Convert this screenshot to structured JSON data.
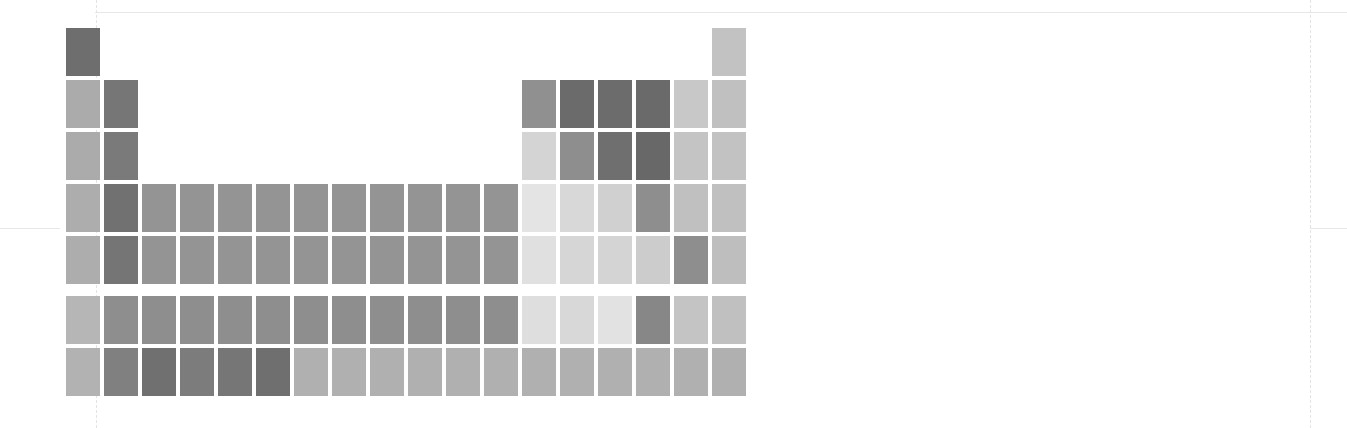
{
  "chart_data": {
    "type": "heatmap",
    "title": "",
    "subtitle": "",
    "xlabel": "",
    "ylabel": "",
    "grid": false,
    "legend_position": "none",
    "layout": "periodic-table",
    "columns": 18,
    "rows": 9,
    "colormap": "greys",
    "value_range": [
      0,
      1
    ],
    "color_scale_min_hex": "#f0f0f0",
    "color_scale_max_hex": "#5a5a5a",
    "background_hex": "#ffffff",
    "cell_width_px": 34,
    "cell_height_px": 48,
    "cell_gap_px": 4,
    "origin_x_px": 66,
    "origin_y_px": 28,
    "f_block_gap_px": 8,
    "guides": {
      "vertical_x_px": [
        38,
        96,
        1310
      ],
      "horizontal_y_px": [
        12,
        228
      ],
      "color_hex": "#e5e5e8"
    },
    "cells": [
      {
        "symbol": "H",
        "col": 1,
        "row": 1,
        "value": 0.62,
        "color": "#6e6e6e"
      },
      {
        "symbol": "He",
        "col": 18,
        "row": 1,
        "value": 0.25,
        "color": "#c2c2c2"
      },
      {
        "symbol": "Li",
        "col": 1,
        "row": 2,
        "value": 0.35,
        "color": "#ababab"
      },
      {
        "symbol": "Be",
        "col": 2,
        "row": 2,
        "value": 0.6,
        "color": "#767676"
      },
      {
        "symbol": "B",
        "col": 13,
        "row": 2,
        "value": 0.47,
        "color": "#909090"
      },
      {
        "symbol": "C",
        "col": 14,
        "row": 2,
        "value": 0.66,
        "color": "#6b6b6b"
      },
      {
        "symbol": "N",
        "col": 15,
        "row": 2,
        "value": 0.66,
        "color": "#6c6c6c"
      },
      {
        "symbol": "O",
        "col": 16,
        "row": 2,
        "value": 0.67,
        "color": "#6a6a6a"
      },
      {
        "symbol": "F",
        "col": 17,
        "row": 2,
        "value": 0.22,
        "color": "#c8c8c8"
      },
      {
        "symbol": "Ne",
        "col": 18,
        "row": 2,
        "value": 0.26,
        "color": "#c0c0c0"
      },
      {
        "symbol": "Na",
        "col": 1,
        "row": 3,
        "value": 0.35,
        "color": "#ababab"
      },
      {
        "symbol": "Mg",
        "col": 2,
        "row": 3,
        "value": 0.58,
        "color": "#7a7a7a"
      },
      {
        "symbol": "Al",
        "col": 13,
        "row": 3,
        "value": 0.16,
        "color": "#d4d4d4"
      },
      {
        "symbol": "Si",
        "col": 14,
        "row": 3,
        "value": 0.48,
        "color": "#8e8e8e"
      },
      {
        "symbol": "P",
        "col": 15,
        "row": 3,
        "value": 0.64,
        "color": "#6f6f6f"
      },
      {
        "symbol": "S",
        "col": 16,
        "row": 3,
        "value": 0.68,
        "color": "#686868"
      },
      {
        "symbol": "Cl",
        "col": 17,
        "row": 3,
        "value": 0.24,
        "color": "#c4c4c4"
      },
      {
        "symbol": "Ar",
        "col": 18,
        "row": 3,
        "value": 0.25,
        "color": "#c2c2c2"
      },
      {
        "symbol": "K",
        "col": 1,
        "row": 4,
        "value": 0.34,
        "color": "#adadad"
      },
      {
        "symbol": "Ca",
        "col": 2,
        "row": 4,
        "value": 0.62,
        "color": "#717171"
      },
      {
        "symbol": "Sc",
        "col": 3,
        "row": 4,
        "value": 0.45,
        "color": "#949494"
      },
      {
        "symbol": "Ti",
        "col": 4,
        "row": 4,
        "value": 0.45,
        "color": "#949494"
      },
      {
        "symbol": "V",
        "col": 5,
        "row": 4,
        "value": 0.45,
        "color": "#949494"
      },
      {
        "symbol": "Cr",
        "col": 6,
        "row": 4,
        "value": 0.45,
        "color": "#949494"
      },
      {
        "symbol": "Mn",
        "col": 7,
        "row": 4,
        "value": 0.45,
        "color": "#949494"
      },
      {
        "symbol": "Fe",
        "col": 8,
        "row": 4,
        "value": 0.45,
        "color": "#949494"
      },
      {
        "symbol": "Co",
        "col": 9,
        "row": 4,
        "value": 0.45,
        "color": "#949494"
      },
      {
        "symbol": "Ni",
        "col": 10,
        "row": 4,
        "value": 0.45,
        "color": "#949494"
      },
      {
        "symbol": "Cu",
        "col": 11,
        "row": 4,
        "value": 0.45,
        "color": "#949494"
      },
      {
        "symbol": "Zn",
        "col": 12,
        "row": 4,
        "value": 0.45,
        "color": "#949494"
      },
      {
        "symbol": "Ga",
        "col": 13,
        "row": 4,
        "value": 0.09,
        "color": "#e4e4e4"
      },
      {
        "symbol": "Ge",
        "col": 14,
        "row": 4,
        "value": 0.14,
        "color": "#d8d8d8"
      },
      {
        "symbol": "As",
        "col": 15,
        "row": 4,
        "value": 0.18,
        "color": "#d0d0d0"
      },
      {
        "symbol": "Se",
        "col": 16,
        "row": 4,
        "value": 0.48,
        "color": "#8e8e8e"
      },
      {
        "symbol": "Br",
        "col": 17,
        "row": 4,
        "value": 0.26,
        "color": "#c0c0c0"
      },
      {
        "symbol": "Kr",
        "col": 18,
        "row": 4,
        "value": 0.26,
        "color": "#c0c0c0"
      },
      {
        "symbol": "Rb",
        "col": 1,
        "row": 5,
        "value": 0.34,
        "color": "#adadad"
      },
      {
        "symbol": "Sr",
        "col": 2,
        "row": 5,
        "value": 0.6,
        "color": "#757575"
      },
      {
        "symbol": "Y",
        "col": 3,
        "row": 5,
        "value": 0.45,
        "color": "#949494"
      },
      {
        "symbol": "Zr",
        "col": 4,
        "row": 5,
        "value": 0.45,
        "color": "#949494"
      },
      {
        "symbol": "Nb",
        "col": 5,
        "row": 5,
        "value": 0.45,
        "color": "#949494"
      },
      {
        "symbol": "Mo",
        "col": 6,
        "row": 5,
        "value": 0.45,
        "color": "#949494"
      },
      {
        "symbol": "Tc",
        "col": 7,
        "row": 5,
        "value": 0.45,
        "color": "#949494"
      },
      {
        "symbol": "Ru",
        "col": 8,
        "row": 5,
        "value": 0.45,
        "color": "#949494"
      },
      {
        "symbol": "Rh",
        "col": 9,
        "row": 5,
        "value": 0.45,
        "color": "#949494"
      },
      {
        "symbol": "Pd",
        "col": 10,
        "row": 5,
        "value": 0.45,
        "color": "#949494"
      },
      {
        "symbol": "Ag",
        "col": 11,
        "row": 5,
        "value": 0.45,
        "color": "#949494"
      },
      {
        "symbol": "Cd",
        "col": 12,
        "row": 5,
        "value": 0.45,
        "color": "#949494"
      },
      {
        "symbol": "In",
        "col": 13,
        "row": 5,
        "value": 0.11,
        "color": "#e0e0e0"
      },
      {
        "symbol": "Sn",
        "col": 14,
        "row": 5,
        "value": 0.15,
        "color": "#d6d6d6"
      },
      {
        "symbol": "Sb",
        "col": 15,
        "row": 5,
        "value": 0.16,
        "color": "#d4d4d4"
      },
      {
        "symbol": "Te",
        "col": 16,
        "row": 5,
        "value": 0.2,
        "color": "#cccccc"
      },
      {
        "symbol": "I",
        "col": 17,
        "row": 5,
        "value": 0.48,
        "color": "#8e8e8e"
      },
      {
        "symbol": "Xe",
        "col": 18,
        "row": 5,
        "value": 0.27,
        "color": "#bebebe"
      },
      {
        "symbol": "Cs",
        "col": 1,
        "row": 6,
        "value": 0.3,
        "color": "#b6b6b6"
      },
      {
        "symbol": "Ba",
        "col": 2,
        "row": 6,
        "value": 0.48,
        "color": "#8e8e8e"
      },
      {
        "symbol": "La",
        "col": 3,
        "row": 6,
        "value": 0.48,
        "color": "#8e8e8e"
      },
      {
        "symbol": "Hf",
        "col": 4,
        "row": 6,
        "value": 0.48,
        "color": "#8e8e8e"
      },
      {
        "symbol": "Ta",
        "col": 5,
        "row": 6,
        "value": 0.48,
        "color": "#8e8e8e"
      },
      {
        "symbol": "W",
        "col": 6,
        "row": 6,
        "value": 0.48,
        "color": "#8e8e8e"
      },
      {
        "symbol": "Re",
        "col": 7,
        "row": 6,
        "value": 0.48,
        "color": "#8e8e8e"
      },
      {
        "symbol": "Os",
        "col": 8,
        "row": 6,
        "value": 0.48,
        "color": "#8e8e8e"
      },
      {
        "symbol": "Ir",
        "col": 9,
        "row": 6,
        "value": 0.48,
        "color": "#8e8e8e"
      },
      {
        "symbol": "Pt",
        "col": 10,
        "row": 6,
        "value": 0.48,
        "color": "#8e8e8e"
      },
      {
        "symbol": "Au",
        "col": 11,
        "row": 6,
        "value": 0.48,
        "color": "#8e8e8e"
      },
      {
        "symbol": "Hg",
        "col": 12,
        "row": 6,
        "value": 0.48,
        "color": "#8e8e8e"
      },
      {
        "symbol": "Tl",
        "col": 13,
        "row": 6,
        "value": 0.12,
        "color": "#dedede"
      },
      {
        "symbol": "Pb",
        "col": 14,
        "row": 6,
        "value": 0.14,
        "color": "#d8d8d8"
      },
      {
        "symbol": "Bi",
        "col": 15,
        "row": 6,
        "value": 0.1,
        "color": "#e2e2e2"
      },
      {
        "symbol": "Po",
        "col": 16,
        "row": 6,
        "value": 0.52,
        "color": "#878787"
      },
      {
        "symbol": "At",
        "col": 17,
        "row": 6,
        "value": 0.24,
        "color": "#c4c4c4"
      },
      {
        "symbol": "Rn",
        "col": 18,
        "row": 6,
        "value": 0.26,
        "color": "#c0c0c0"
      },
      {
        "symbol": "Fr",
        "col": 1,
        "row": 7,
        "value": 0.32,
        "color": "#b2b2b2"
      },
      {
        "symbol": "Ra",
        "col": 2,
        "row": 7,
        "value": 0.55,
        "color": "#808080"
      },
      {
        "symbol": "Ac",
        "col": 3,
        "row": 7,
        "value": 0.63,
        "color": "#707070"
      },
      {
        "symbol": "Rf",
        "col": 4,
        "row": 7,
        "value": 0.57,
        "color": "#7c7c7c"
      },
      {
        "symbol": "Db",
        "col": 5,
        "row": 7,
        "value": 0.6,
        "color": "#767676"
      },
      {
        "symbol": "Sg",
        "col": 6,
        "row": 7,
        "value": 0.64,
        "color": "#6f6f6f"
      },
      {
        "symbol": "Bh",
        "col": 7,
        "row": 7,
        "value": 0.33,
        "color": "#b0b0b0"
      },
      {
        "symbol": "Hs",
        "col": 8,
        "row": 7,
        "value": 0.33,
        "color": "#b0b0b0"
      },
      {
        "symbol": "Mt",
        "col": 9,
        "row": 7,
        "value": 0.33,
        "color": "#b0b0b0"
      },
      {
        "symbol": "Ds",
        "col": 10,
        "row": 7,
        "value": 0.33,
        "color": "#b0b0b0"
      },
      {
        "symbol": "Rg",
        "col": 11,
        "row": 7,
        "value": 0.33,
        "color": "#b0b0b0"
      },
      {
        "symbol": "Cn",
        "col": 12,
        "row": 7,
        "value": 0.33,
        "color": "#b0b0b0"
      },
      {
        "symbol": "Nh",
        "col": 13,
        "row": 7,
        "value": 0.33,
        "color": "#b0b0b0"
      },
      {
        "symbol": "Fl",
        "col": 14,
        "row": 7,
        "value": 0.33,
        "color": "#b0b0b0"
      },
      {
        "symbol": "Mc",
        "col": 15,
        "row": 7,
        "value": 0.33,
        "color": "#b0b0b0"
      },
      {
        "symbol": "Lv",
        "col": 16,
        "row": 7,
        "value": 0.33,
        "color": "#b0b0b0"
      },
      {
        "symbol": "Ts",
        "col": 17,
        "row": 7,
        "value": 0.33,
        "color": "#b0b0b0"
      },
      {
        "symbol": "Og",
        "col": 18,
        "row": 7,
        "value": 0.33,
        "color": "#b0b0b0"
      }
    ]
  }
}
